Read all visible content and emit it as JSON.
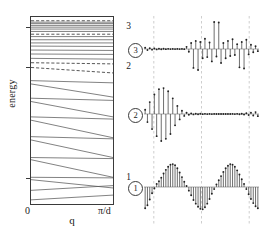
{
  "figure": {
    "caption_absent": true,
    "panels": [
      "band-structure",
      "wavefunctions"
    ]
  },
  "band_panel": {
    "xlabel": "q",
    "ylabel": "energy",
    "x_tick_min": "0",
    "x_tick_max": "π/d",
    "y_ticks": [
      "1",
      "2",
      "3"
    ],
    "colors": {
      "axis": "#3a3a3a",
      "band": "#555555",
      "marker": "#222222"
    }
  },
  "wf_panel": {
    "labels": [
      "1",
      "2",
      "3"
    ],
    "colors": {
      "stem": "#555555",
      "baseline": "#888888",
      "gridline": "#b9b9b9"
    }
  },
  "chart_data": [
    {
      "type": "line",
      "name": "band-structure",
      "title": "",
      "xlabel": "q",
      "ylabel": "energy",
      "xlim": [
        0,
        1
      ],
      "ylim": [
        0.55,
        3.25
      ],
      "xtick_labels": [
        "0",
        "π/d"
      ],
      "xtick_values": [
        0,
        1
      ],
      "ytick_labels": [
        "1",
        "2",
        "3"
      ],
      "ytick_values": [
        1,
        2,
        3
      ],
      "grid": false,
      "legend": "none",
      "note": "Each band is drawn as a segment from q=0 to q=π/d. Low-energy bands are strongly dispersive (steeply sloped); high-energy bands are nearly flat. Dashed bands mark the energies of the three plotted eigenstates.",
      "bands": [
        {
          "e_at_0": 0.62,
          "e_at_pi": 0.7,
          "style": "solid"
        },
        {
          "e_at_0": 0.78,
          "e_at_pi": 0.86,
          "style": "solid"
        },
        {
          "e_at_0": 0.96,
          "e_at_pi": 0.82,
          "style": "solid"
        },
        {
          "e_at_0": 1.0,
          "e_at_pi": 0.99,
          "style": "solid"
        },
        {
          "e_at_0": 1.16,
          "e_at_pi": 1.0,
          "style": "solid"
        },
        {
          "e_at_0": 1.18,
          "e_at_pi": 1.17,
          "style": "solid"
        },
        {
          "e_at_0": 1.34,
          "e_at_pi": 1.18,
          "style": "solid"
        },
        {
          "e_at_0": 1.37,
          "e_at_pi": 1.35,
          "style": "solid"
        },
        {
          "e_at_0": 1.52,
          "e_at_pi": 1.36,
          "style": "solid"
        },
        {
          "e_at_0": 1.55,
          "e_at_pi": 1.53,
          "style": "solid"
        },
        {
          "e_at_0": 1.69,
          "e_at_pi": 1.55,
          "style": "solid"
        },
        {
          "e_at_0": 1.72,
          "e_at_pi": 1.7,
          "style": "solid"
        },
        {
          "e_at_0": 1.85,
          "e_at_pi": 1.73,
          "style": "solid"
        },
        {
          "e_at_0": 1.88,
          "e_at_pi": 1.86,
          "style": "solid"
        },
        {
          "e_at_0": 2.0,
          "e_at_pi": 1.95,
          "style": "dashed",
          "eigenstate": "2"
        },
        {
          "e_at_0": 2.12,
          "e_at_pi": 2.09,
          "style": "dashed"
        },
        {
          "e_at_0": 2.23,
          "e_at_pi": 2.21,
          "style": "solid"
        },
        {
          "e_at_0": 2.34,
          "e_at_pi": 2.33,
          "style": "solid"
        },
        {
          "e_at_0": 2.44,
          "e_at_pi": 2.43,
          "style": "solid"
        },
        {
          "e_at_0": 2.54,
          "e_at_pi": 2.53,
          "style": "solid"
        },
        {
          "e_at_0": 2.62,
          "e_at_pi": 2.62,
          "style": "solid"
        },
        {
          "e_at_0": 2.7,
          "e_at_pi": 2.7,
          "style": "solid"
        },
        {
          "e_at_0": 2.78,
          "e_at_pi": 2.78,
          "style": "solid"
        },
        {
          "e_at_0": 2.84,
          "e_at_pi": 2.84,
          "style": "dashed",
          "eigenstate": "3"
        },
        {
          "e_at_0": 2.91,
          "e_at_pi": 2.91,
          "style": "solid"
        },
        {
          "e_at_0": 2.97,
          "e_at_pi": 2.97,
          "style": "solid"
        },
        {
          "e_at_0": 3.02,
          "e_at_pi": 3.02,
          "style": "solid"
        },
        {
          "e_at_0": 3.07,
          "e_at_pi": 3.07,
          "style": "solid"
        },
        {
          "e_at_0": 3.12,
          "e_at_pi": 3.12,
          "style": "solid"
        },
        {
          "e_at_0": 3.16,
          "e_at_pi": 3.16,
          "style": "solid"
        },
        {
          "e_at_0": 3.2,
          "e_at_pi": 3.2,
          "style": "dashed"
        }
      ]
    },
    {
      "type": "bar",
      "name": "wavefunction-1",
      "title": "1",
      "xlabel": "",
      "ylabel": "",
      "grid": true,
      "gridline_x": [
        0.085,
        0.5,
        0.915
      ],
      "legend": "none",
      "note": "Extended Bloch-like state: amplitude modulated periodically across the whole chain, with markers at each site.",
      "values": [
        -0.82,
        -0.7,
        -0.48,
        -0.24,
        -0.06,
        0.12,
        0.22,
        0.36,
        0.52,
        0.66,
        0.78,
        0.86,
        0.88,
        0.84,
        0.72,
        0.56,
        0.38,
        0.2,
        0.04,
        -0.14,
        -0.32,
        -0.5,
        -0.64,
        -0.76,
        -0.84,
        -0.86,
        -0.78,
        -0.64,
        -0.46,
        -0.26,
        -0.08,
        0.1,
        0.26,
        0.42,
        0.58,
        0.72,
        0.82,
        0.88,
        0.86,
        0.78,
        0.64,
        0.48,
        0.3,
        0.12,
        -0.08,
        -0.28,
        -0.46,
        -0.62,
        -0.74,
        -0.82
      ]
    },
    {
      "type": "bar",
      "name": "wavefunction-2",
      "title": "2",
      "xlabel": "",
      "ylabel": "",
      "grid": true,
      "gridline_x": [
        0.085,
        0.5,
        0.915
      ],
      "legend": "none",
      "note": "State localized in the left half; staggered sign alternation with a smooth envelope, decaying to near zero on the right.",
      "values": [
        0.16,
        -0.3,
        0.44,
        -0.56,
        0.72,
        -0.82,
        0.92,
        -1.0,
        0.96,
        -0.92,
        0.84,
        -0.74,
        0.58,
        -0.42,
        0.3,
        -0.2,
        0.12,
        -0.07,
        0.05,
        -0.03,
        0.02,
        -0.015,
        0.012,
        -0.01,
        0.008,
        -0.006,
        0.005,
        -0.004,
        0.004,
        -0.003,
        0.003,
        -0.002,
        0.002,
        -0.002,
        0.002,
        -0.002,
        0.002,
        -0.002,
        0.003,
        -0.004,
        0.005,
        -0.008,
        0.012,
        -0.018,
        0.03,
        -0.04,
        0.05,
        -0.06,
        0.07,
        -0.08
      ]
    },
    {
      "type": "bar",
      "name": "wavefunction-3",
      "title": "3",
      "xlabel": "",
      "ylabel": "",
      "grid": true,
      "gridline_x": [
        0.085,
        0.5,
        0.915
      ],
      "legend": "none",
      "note": "State localized in the right half; irregular alternating amplitudes with the largest spikes near the centre-right, essentially zero on the left.",
      "values": [
        0.05,
        -0.04,
        0.03,
        -0.025,
        0.02,
        -0.015,
        0.012,
        -0.01,
        0.008,
        -0.006,
        0.005,
        -0.004,
        0.004,
        -0.003,
        0.003,
        -0.003,
        0.004,
        -0.005,
        0.08,
        -0.1,
        0.22,
        -0.7,
        0.3,
        -0.78,
        0.26,
        -0.34,
        0.38,
        -0.3,
        0.24,
        -0.46,
        1.0,
        -0.28,
        0.98,
        -0.52,
        0.22,
        -0.34,
        0.3,
        -0.26,
        0.36,
        -0.22,
        0.18,
        -0.68,
        0.26,
        -0.72,
        0.34,
        -0.2,
        0.16,
        -0.12,
        0.1,
        -0.08
      ]
    }
  ]
}
